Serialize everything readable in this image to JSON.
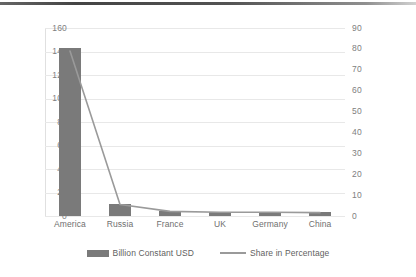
{
  "chart_data": {
    "type": "bar",
    "title": "",
    "subtitle": "",
    "xlabel": "",
    "ylabel": "",
    "categories": [
      "America",
      "Russia",
      "France",
      "UK",
      "Germany",
      "China"
    ],
    "grid": true,
    "legend_position": "bottom",
    "axes": {
      "left": {
        "label": "Billion Constant USD",
        "min": 0,
        "max": 160,
        "step": 20,
        "ticks": [
          "0",
          "20",
          "40",
          "60",
          "80",
          "100",
          "120",
          "140",
          "160"
        ]
      },
      "right": {
        "label": "Share in Percentage",
        "min": 0,
        "max": 90,
        "step": 10,
        "ticks": [
          "0",
          "10",
          "20",
          "30",
          "40",
          "50",
          "60",
          "70",
          "80",
          "90"
        ]
      }
    },
    "series": [
      {
        "name": "Billion Constant USD",
        "type": "bar",
        "axis": "left",
        "color": "#7a7a7a",
        "values": [
          143,
          10,
          4,
          3,
          3,
          3
        ]
      },
      {
        "name": "Share in Percentage",
        "type": "line",
        "axis": "right",
        "color": "#9a9a9a",
        "values": [
          79,
          5.5,
          2.2,
          1.8,
          1.8,
          1.6
        ]
      }
    ]
  },
  "legend": {
    "items": [
      {
        "label": "Billion Constant USD",
        "marker": "bar-swatch-icon"
      },
      {
        "label": "Share in Percentage",
        "marker": "line-swatch-icon"
      }
    ]
  }
}
